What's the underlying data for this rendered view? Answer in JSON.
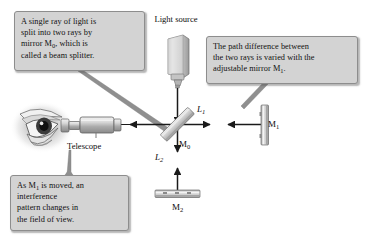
{
  "figure": {
    "background_color": "#ffffff"
  },
  "callouts": [
    {
      "id": "splitter",
      "name": "callout-beam-splitter",
      "text": "A single ray of light is split into two rays by mirror M0, which is called a beam splitter.",
      "line1": "A single ray of light is",
      "line2": "split into two rays by",
      "line3_a": "mirror M",
      "line3_sub": "0",
      "line3_b": ", which is",
      "line4": "called a beam splitter.",
      "fill_color": "#d3d3d3",
      "border_color": "#8d8d8d",
      "points_to": "beam-splitter-m0"
    },
    {
      "id": "path",
      "name": "callout-path-difference",
      "text": "The path difference between the two rays is varied with the adjustable mirror M1.",
      "line1": "The path difference between",
      "line2": "the two rays is varied with the",
      "line3_a": "adjustable mirror M",
      "line3_sub": "1",
      "line3_b": ".",
      "fill_color": "#d3d3d3",
      "border_color": "#8d8d8d",
      "points_to": "mirror-m1"
    },
    {
      "id": "interference",
      "name": "callout-interference-pattern",
      "text": "As M1 is moved, an interference pattern changes in the field of view.",
      "line1_a": "As M",
      "line1_sub": "1",
      "line1_b": " is moved, an",
      "line2": "interference",
      "line3": "pattern changes in",
      "line4": "the field of view.",
      "fill_color": "#d3d3d3",
      "border_color": "#8d8d8d",
      "points_to": "telescope"
    }
  ],
  "labels": {
    "light_source": "Light source",
    "telescope": "Telescope",
    "mirror_m0_base": "M",
    "mirror_m0_sub": "0",
    "mirror_m1_base": "M",
    "mirror_m1_sub": "1",
    "mirror_m2_base": "M",
    "mirror_m2_sub": "2",
    "arm_l1_base": "L",
    "arm_l1_sub": "1",
    "arm_l2_base": "L",
    "arm_l2_sub": "2"
  },
  "components": [
    {
      "name": "light-source-lamp",
      "label": "Light source",
      "position": "top-center"
    },
    {
      "name": "beam-splitter-m0",
      "label": "M0",
      "position": "center",
      "angle_deg": 45
    },
    {
      "name": "mirror-m1",
      "label": "M1",
      "position": "right",
      "orientation": "vertical"
    },
    {
      "name": "mirror-m2",
      "label": "M2",
      "position": "bottom",
      "orientation": "horizontal"
    },
    {
      "name": "telescope",
      "label": "Telescope",
      "position": "left"
    },
    {
      "name": "observer-eye",
      "label": "eye",
      "position": "far-left"
    }
  ],
  "beams": [
    {
      "name": "beam-source-to-splitter",
      "from": "light-source-lamp",
      "to": "beam-splitter-m0",
      "direction": "down"
    },
    {
      "name": "beam-arm-l1",
      "from": "beam-splitter-m0",
      "to": "mirror-m1",
      "label": "L1",
      "direction": "bidirectional"
    },
    {
      "name": "beam-arm-l2",
      "from": "beam-splitter-m0",
      "to": "mirror-m2",
      "label": "L2",
      "direction": "bidirectional"
    },
    {
      "name": "beam-splitter-to-telescope",
      "from": "beam-splitter-m0",
      "to": "telescope",
      "direction": "left"
    }
  ],
  "colors": {
    "beam_line": "#1a1a1a",
    "callout_fill": "#d3d3d3",
    "callout_border": "#8d8d8d",
    "metal_light": "#e8e8e8",
    "metal_mid": "#b9b9b9",
    "metal_dark": "#7c7c7c",
    "text": "#101010"
  }
}
